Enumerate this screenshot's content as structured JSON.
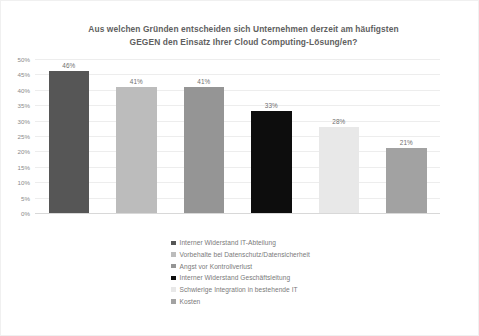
{
  "chart_data": {
    "type": "bar",
    "title": "Aus welchen Gründen entscheiden sich Unternehmen derzeit am häufigsten GEGEN den Einsatz Ihrer Cloud Computing-Lösung/en?",
    "title_lines": [
      "Aus welchen Gründen entscheiden sich Unternehmen derzeit am häufigsten",
      "GEGEN den Einsatz Ihrer Cloud Computing-Lösung/en?"
    ],
    "xlabel": "",
    "ylabel": "",
    "ylim": [
      0,
      50
    ],
    "grid": true,
    "legend_position": "bottom",
    "categories": [
      "Interner Widerstand IT-Abteilung",
      "Vorbehalte bei Datenschutz/Datensicherheit",
      "Angst vor Kontrollverlust",
      "Interner Widerstand Geschäftsleitung",
      "Schwierige Integration in bestehende IT",
      "Kosten"
    ],
    "values": [
      46,
      41,
      41,
      33,
      28,
      21
    ],
    "value_labels": [
      "46%",
      "41%",
      "41%",
      "33%",
      "28%",
      "21%"
    ],
    "colors": [
      "#565656",
      "#bcbcbc",
      "#959595",
      "#0d0d0d",
      "#e8e8e8",
      "#a2a2a2"
    ],
    "ytick_labels": [
      "50%",
      "45%",
      "40%",
      "35%",
      "30%",
      "25%",
      "20%",
      "15%",
      "10%",
      "5%",
      "0%"
    ],
    "ytick_values": [
      50,
      45,
      40,
      35,
      30,
      25,
      20,
      15,
      10,
      5,
      0
    ]
  },
  "legend": {
    "items": [
      {
        "label": "Interner Widerstand IT-Abteilung",
        "color": "#565656"
      },
      {
        "label": "Vorbehalte bei Datenschutz/Datensicherheit",
        "color": "#bcbcbc"
      },
      {
        "label": "Angst vor Kontrollverlust",
        "color": "#959595"
      },
      {
        "label": "Interner Widerstand Geschäftsleitung",
        "color": "#0d0d0d"
      },
      {
        "label": "Schwierige Integration in bestehende IT",
        "color": "#e8e8e8"
      },
      {
        "label": "Kosten",
        "color": "#a2a2a2"
      }
    ]
  }
}
